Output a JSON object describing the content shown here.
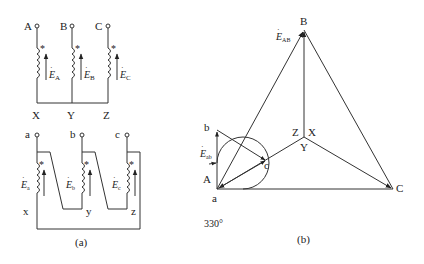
{
  "figure": {
    "panel_a": {
      "caption": "(a)",
      "primary": {
        "terminals_top": [
          "A",
          "B",
          "C"
        ],
        "terminals_bottom": [
          "X",
          "Y",
          "Z"
        ],
        "polarity_mark": "*",
        "emf_labels": [
          {
            "base": "E",
            "sub": "A"
          },
          {
            "base": "E",
            "sub": "B"
          },
          {
            "base": "E",
            "sub": "C"
          }
        ],
        "connection": "star (Y)"
      },
      "secondary": {
        "terminals_top": [
          "a",
          "b",
          "c"
        ],
        "terminals_bottom": [
          "x",
          "y",
          "z"
        ],
        "polarity_mark": "*",
        "emf_labels": [
          {
            "base": "E",
            "sub": "a"
          },
          {
            "base": "E",
            "sub": "b"
          },
          {
            "base": "E",
            "sub": "c"
          }
        ],
        "connection": "delta"
      }
    },
    "panel_b": {
      "caption": "(b)",
      "vertices": {
        "A": "A",
        "B": "B",
        "C": "C",
        "a": "a",
        "b": "b",
        "c": "c"
      },
      "center_labels": [
        "Z",
        "X",
        "Y"
      ],
      "emf_AB": {
        "base": "E",
        "sub": "AB"
      },
      "emf_ab": {
        "base": "E",
        "sub": "ab"
      },
      "angle_label": "330°"
    }
  },
  "colors": {
    "line": "#333333",
    "background": "#ffffff"
  }
}
